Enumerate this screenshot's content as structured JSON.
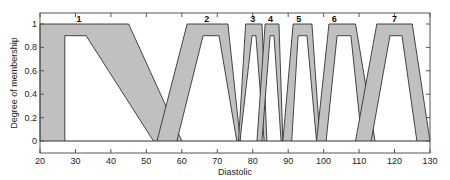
{
  "chart_data": {
    "type": "area",
    "title": "",
    "xlabel": "Diastolic",
    "ylabel": "Degree of membership",
    "xlim": [
      20,
      130
    ],
    "ylim": [
      -0.1,
      1.1
    ],
    "xticks": [
      20,
      30,
      40,
      50,
      60,
      70,
      80,
      90,
      100,
      110,
      120,
      130
    ],
    "yticks": [
      0,
      0.2,
      0.4,
      0.6,
      0.8,
      1
    ],
    "ytick_labels": [
      "0",
      "0.2",
      "0.4",
      "0.6",
      "0.8",
      "1"
    ],
    "grid": false,
    "legend": "none",
    "fill_color": "#c0c0c0",
    "line_color": "#333333",
    "sets": [
      {
        "label": "1",
        "label_x": 31,
        "upper": [
          [
            20,
            0
          ],
          [
            20,
            1
          ],
          [
            45,
            1
          ],
          [
            60,
            0
          ]
        ],
        "lower": [
          [
            27,
            0
          ],
          [
            27,
            0.9
          ],
          [
            33,
            0.9
          ],
          [
            52,
            0
          ]
        ]
      },
      {
        "label": "2",
        "label_x": 67,
        "upper": [
          [
            53,
            0
          ],
          [
            61.5,
            1
          ],
          [
            73,
            1
          ],
          [
            76.5,
            0
          ]
        ],
        "lower": [
          [
            58.6,
            0
          ],
          [
            66,
            0.9
          ],
          [
            70.5,
            0.9
          ],
          [
            75.5,
            0
          ]
        ]
      },
      {
        "label": "3",
        "label_x": 80,
        "upper": [
          [
            76,
            0
          ],
          [
            78,
            1
          ],
          [
            82.6,
            1
          ],
          [
            84,
            0
          ]
        ],
        "lower": [
          [
            76.4,
            0
          ],
          [
            79.8,
            0.9
          ],
          [
            80.9,
            0.9
          ],
          [
            83.2,
            0
          ]
        ]
      },
      {
        "label": "4",
        "label_x": 85,
        "upper": [
          [
            81.2,
            0
          ],
          [
            83.5,
            1
          ],
          [
            87.4,
            1
          ],
          [
            88.5,
            0
          ]
        ],
        "lower": [
          [
            82.6,
            0
          ],
          [
            84.9,
            0.9
          ],
          [
            86,
            0.9
          ],
          [
            88,
            0
          ]
        ]
      },
      {
        "label": "5",
        "label_x": 93,
        "upper": [
          [
            88.5,
            0
          ],
          [
            91.4,
            1
          ],
          [
            96.7,
            1
          ],
          [
            99,
            0
          ]
        ],
        "lower": [
          [
            91,
            0
          ],
          [
            92.8,
            0.9
          ],
          [
            95.3,
            0.9
          ],
          [
            98,
            0
          ]
        ]
      },
      {
        "label": "6",
        "label_x": 103,
        "upper": [
          [
            98,
            0
          ],
          [
            101.5,
            1
          ],
          [
            109,
            1
          ],
          [
            114.5,
            0
          ]
        ],
        "lower": [
          [
            100.7,
            0
          ],
          [
            103.8,
            0.9
          ],
          [
            107.7,
            0.9
          ],
          [
            110.8,
            0
          ]
        ]
      },
      {
        "label": "7",
        "label_x": 120,
        "upper": [
          [
            109,
            0
          ],
          [
            115,
            1
          ],
          [
            125,
            1
          ],
          [
            130,
            0
          ]
        ],
        "lower": [
          [
            113.4,
            0
          ],
          [
            118.7,
            0.9
          ],
          [
            122.1,
            0.9
          ],
          [
            126.3,
            0
          ]
        ]
      }
    ]
  }
}
